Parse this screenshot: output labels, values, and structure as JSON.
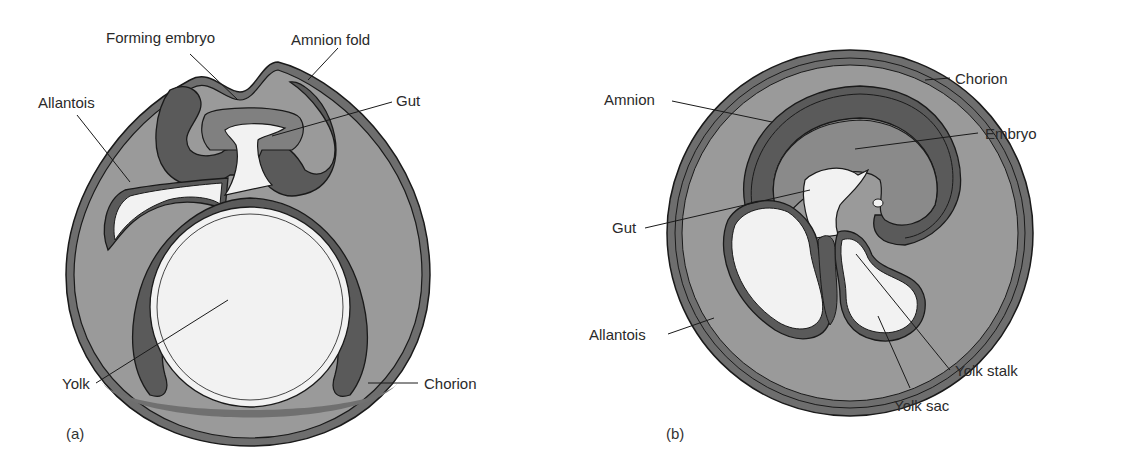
{
  "figure": {
    "panels": [
      {
        "id": "a",
        "panel_label": "(a)",
        "labels": {
          "forming_embryo": "Forming embryo",
          "amnion_fold": "Amnion fold",
          "allantois": "Allantois",
          "gut": "Gut",
          "yolk": "Yolk",
          "chorion": "Chorion"
        }
      },
      {
        "id": "b",
        "panel_label": "(b)",
        "labels": {
          "chorion": "Chorion",
          "amnion": "Amnion",
          "embryo": "Embryo",
          "gut": "Gut",
          "allantois": "Allantois",
          "yolk_stalk": "Yolk stalk",
          "yolk_sac": "Yolk sac"
        }
      }
    ],
    "colors": {
      "outer_membrane": "#6e6e6e",
      "cavity_fill": "#9a9a9a",
      "dark_layer": "#5a5a5a",
      "embryo_fill": "#8a8a8a",
      "yolk_fill": "#f2f2f2",
      "outline": "#1a1a1a"
    }
  }
}
